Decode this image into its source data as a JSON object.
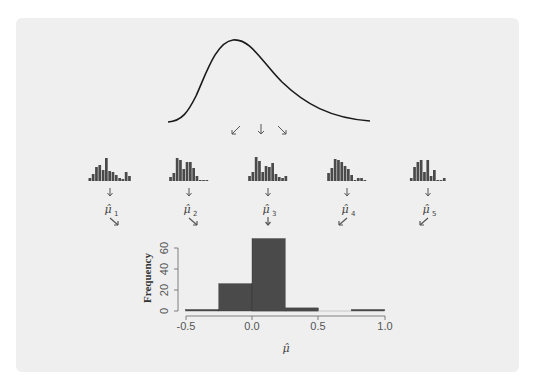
{
  "figure": {
    "background_color": "#efefef",
    "bar_color": "#4a4a4a",
    "curve_color": "#1a1a1a"
  },
  "population": {
    "description": "right-skewed density curve",
    "arrows": [
      "down-left",
      "down",
      "down-right"
    ]
  },
  "samples": [
    {
      "label": "μ̂",
      "subscript": "1",
      "heights": [
        3,
        7,
        14,
        16,
        11,
        23,
        10,
        9,
        6,
        3,
        2,
        9,
        5
      ],
      "out_arrow": "down-right"
    },
    {
      "label": "μ̂",
      "subscript": "2",
      "heights": [
        4,
        8,
        23,
        21,
        12,
        19,
        19,
        13,
        5,
        1,
        1,
        1
      ],
      "out_arrow": "down-right"
    },
    {
      "label": "μ̂",
      "subscript": "3",
      "heights": [
        5,
        9,
        24,
        20,
        9,
        15,
        14,
        18,
        7,
        4,
        3,
        5
      ],
      "out_arrow": "down"
    },
    {
      "label": "μ̂",
      "subscript": "4",
      "heights": [
        8,
        13,
        22,
        21,
        19,
        15,
        12,
        6,
        1,
        3,
        3,
        1
      ],
      "out_arrow": "down-left"
    },
    {
      "label": "μ̂",
      "subscript": "5",
      "heights": [
        3,
        14,
        19,
        21,
        9,
        21,
        5,
        11,
        1,
        1,
        3
      ],
      "out_arrow": "down-left"
    }
  ],
  "chart_data": {
    "type": "bar",
    "title": "",
    "xlabel": "μ̂",
    "ylabel": "Frequency",
    "bins": [
      [
        -0.5,
        -0.25
      ],
      [
        -0.25,
        0.0
      ],
      [
        0.0,
        0.25
      ],
      [
        0.25,
        0.5
      ],
      [
        0.5,
        0.75
      ],
      [
        0.75,
        1.0
      ]
    ],
    "categories": [
      "-0.5 to -0.25",
      "-0.25 to 0.0",
      "0.0 to 0.25",
      "0.25 to 0.5",
      "0.5 to 0.75",
      "0.75 to 1.0"
    ],
    "values": [
      1,
      26,
      69,
      3,
      0,
      1
    ],
    "xlim": [
      -0.5,
      1.0
    ],
    "ylim": [
      0,
      70
    ],
    "x_ticks": [
      "-0.5",
      "0.0",
      "0.5",
      "1.0"
    ],
    "y_ticks": [
      "0",
      "20",
      "40",
      "60"
    ],
    "grid": false
  }
}
